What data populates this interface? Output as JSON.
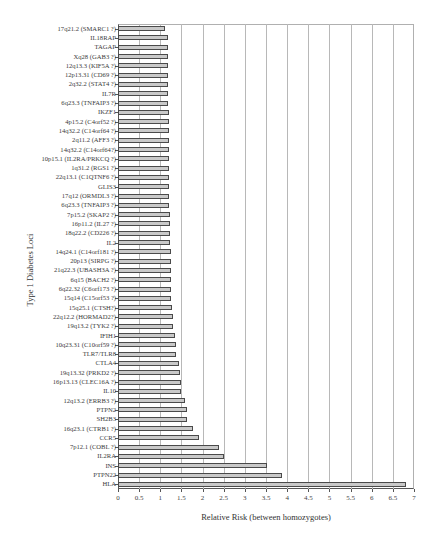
{
  "chart_data": {
    "type": "bar",
    "orientation": "horizontal",
    "title": "",
    "xlabel": "Relative Risk (between homozygotes)",
    "ylabel": "Type 1 Diabetes Loci",
    "xlim": [
      0,
      7
    ],
    "xticks": [
      "0",
      "0.5",
      "1",
      "1.5",
      "2",
      "2.5",
      "3",
      "3.5",
      "4",
      "4.5",
      "5",
      "5.5",
      "6",
      "6.5",
      "7"
    ],
    "grid": "vertical",
    "legend": "none",
    "bar_color": "#c9c9c9",
    "categories": [
      "17q21.2 (SMARC1 ?)",
      "IL18RAP",
      "TAGAP",
      "Xq28 (GAB3 ?)",
      "12q13.3 (KIF5A ?)",
      "12p13.31 (CD69 ?)",
      "2q32.2 (STAT4 ?)",
      "IL7R",
      "6q23.3 (TNFAIP3 ?)",
      "IKZF1",
      "4p15.2 (C4orf52 ?)",
      "14q32.2 (C14orf64 ?)",
      "2q11.2 (AFF3 ?)",
      "14q32.2 (C14orf64?)",
      "10p15.1 (IL2RA/PRKCQ ?)",
      "1q31.2 (RGS1 ?)",
      "22q13.1 (C1QTNF6 ?)",
      "GLIS3",
      "17q12 (ORMDL3 ?)",
      "6q23.3 (TNFAIP3 ?)",
      "7p15.2 (SKAP2 ?)",
      "16p11.2 (IL27 ?)",
      "18q22.2 (CD226 ?)",
      "IL2",
      "14q24.1 (C14orf181 ?)",
      "20p13 (SIRPG ?)",
      "21q22.3 (UBASH3A ?)",
      "6q15 (BACH2 ?)",
      "6q22.32 (C6orf173 ?)",
      "15q14 (C15orf53 ?)",
      "15q25.1 (CTSH?)",
      "22q12.2 (HORMAD2?)",
      "19q13.2 (TYK2 ?)",
      "IFIH1",
      "10q23.31 (C10orf59 ?)",
      "TLR7/TLR8",
      "CTLA4",
      "19q13.32 (PRKD2 ?)",
      "16p13.13 (CLEC16A ?)",
      "IL10",
      "12q13.2 (ERRB3 ?)",
      "PTPN2",
      "SH2B3",
      "16q23.1 (CTRB1 ?)",
      "CCR5",
      "7p12.1 (COBL ?)",
      "IL2RA",
      "INS",
      "PTPN22",
      "HLA"
    ],
    "values": [
      1.1,
      1.18,
      1.18,
      1.18,
      1.18,
      1.18,
      1.18,
      1.19,
      1.19,
      1.2,
      1.2,
      1.2,
      1.2,
      1.21,
      1.21,
      1.21,
      1.21,
      1.21,
      1.21,
      1.21,
      1.23,
      1.24,
      1.24,
      1.24,
      1.26,
      1.26,
      1.26,
      1.26,
      1.26,
      1.26,
      1.27,
      1.29,
      1.29,
      1.34,
      1.36,
      1.36,
      1.45,
      1.47,
      1.5,
      1.5,
      1.58,
      1.62,
      1.64,
      1.77,
      1.92,
      2.38,
      2.5,
      3.52,
      3.88,
      6.8
    ]
  }
}
